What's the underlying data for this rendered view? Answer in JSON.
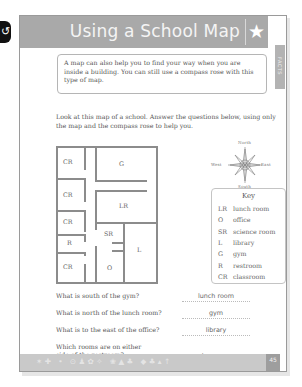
{
  "side_tab": {
    "glyph": "↺"
  },
  "header": {
    "title": "Using a School Map",
    "star_icon": "★"
  },
  "facts_tab": {
    "label": "FACTS"
  },
  "intro": "A map can also help you to find your way when you are inside a building. You can still use a compass rose with this type of map.",
  "instructions": "Look at this map of a school. Answer the questions below, using only the map and the compass rose to help you.",
  "map": {
    "rooms": [
      {
        "label": "CR",
        "position": "top-left"
      },
      {
        "label": "G",
        "position": "top-right"
      },
      {
        "label": "CR",
        "position": "left-2"
      },
      {
        "label": "LR",
        "position": "right-2"
      },
      {
        "label": "CR",
        "position": "left-3"
      },
      {
        "label": "SR",
        "position": "center"
      },
      {
        "label": "R",
        "position": "left-4"
      },
      {
        "label": "L",
        "position": "bottom-right"
      },
      {
        "label": "CR",
        "position": "bottom-left"
      },
      {
        "label": "O",
        "position": "bottom-center"
      }
    ]
  },
  "compass": {
    "north": "North",
    "south": "South",
    "east": "East",
    "west": "West"
  },
  "key": {
    "title": "Key",
    "entries": [
      {
        "abbr": "LR",
        "meaning": "lunch room"
      },
      {
        "abbr": "O",
        "meaning": "office"
      },
      {
        "abbr": "SR",
        "meaning": "science room"
      },
      {
        "abbr": "L",
        "meaning": "library"
      },
      {
        "abbr": "G",
        "meaning": "gym"
      },
      {
        "abbr": "R",
        "meaning": "restroom"
      },
      {
        "abbr": "CR",
        "meaning": "classroom"
      }
    ]
  },
  "questions": [
    {
      "question": "What is south of the gym?",
      "answer": "lunch room"
    },
    {
      "question": "What is north of the lunch room?",
      "answer": "gym"
    },
    {
      "question": "What is to the east of the office?",
      "answer": "library"
    },
    {
      "question": "Which rooms are on either side of the restroom?",
      "answer": "classrooms"
    }
  ],
  "footer": {
    "icons": "✶✚ • ⊙♟✿✧ ❀▲♣ ◆♣▴↑",
    "page_number": "45"
  }
}
